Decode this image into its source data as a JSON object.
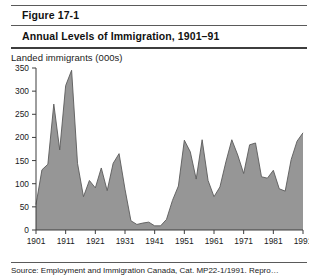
{
  "figure": {
    "number": "Figure 17-1",
    "title": "Annual Levels of Immigration, 1901–91",
    "source": "Source:   Employment and Immigration Canada, Cat. MP22-1/1991. Repro…"
  },
  "chart_data": {
    "type": "area",
    "title": "Annual Levels of Immigration, 1901–91",
    "xlabel": "",
    "ylabel": "Landed immigrants (000s)",
    "ylim": [
      0,
      350
    ],
    "xlim": [
      1901,
      1991
    ],
    "ytick_labels": [
      "0",
      "50",
      "100",
      "150",
      "200",
      "250",
      "300",
      "350"
    ],
    "ytick_values": [
      0,
      50,
      100,
      150,
      200,
      250,
      300,
      350
    ],
    "xtick_labels": [
      "1901",
      "1911",
      "1921",
      "1931",
      "1941",
      "1951",
      "1961",
      "1971",
      "1981",
      "1991"
    ],
    "xtick_values": [
      1901,
      1911,
      1921,
      1931,
      1941,
      1951,
      1961,
      1971,
      1981,
      1991
    ],
    "grid": false,
    "legend": null,
    "fill_color": "#969696",
    "line_color": "#5a5a5a",
    "series": [
      {
        "name": "Landed immigrants (000s)",
        "x": [
          1901,
          1903,
          1905,
          1907,
          1909,
          1911,
          1913,
          1915,
          1917,
          1919,
          1921,
          1923,
          1925,
          1927,
          1929,
          1931,
          1933,
          1935,
          1937,
          1939,
          1941,
          1943,
          1945,
          1947,
          1949,
          1951,
          1953,
          1955,
          1957,
          1959,
          1961,
          1963,
          1965,
          1967,
          1969,
          1971,
          1973,
          1975,
          1977,
          1979,
          1981,
          1983,
          1985,
          1987,
          1989,
          1991
        ],
        "values": [
          55,
          130,
          142,
          272,
          173,
          312,
          345,
          144,
          72,
          107,
          91,
          134,
          85,
          144,
          165,
          88,
          20,
          12,
          15,
          17,
          9,
          9,
          23,
          64,
          95,
          194,
          169,
          110,
          195,
          107,
          72,
          93,
          147,
          195,
          162,
          122,
          184,
          188,
          115,
          112,
          129,
          89,
          84,
          152,
          192,
          210
        ]
      }
    ],
    "annotations": []
  }
}
